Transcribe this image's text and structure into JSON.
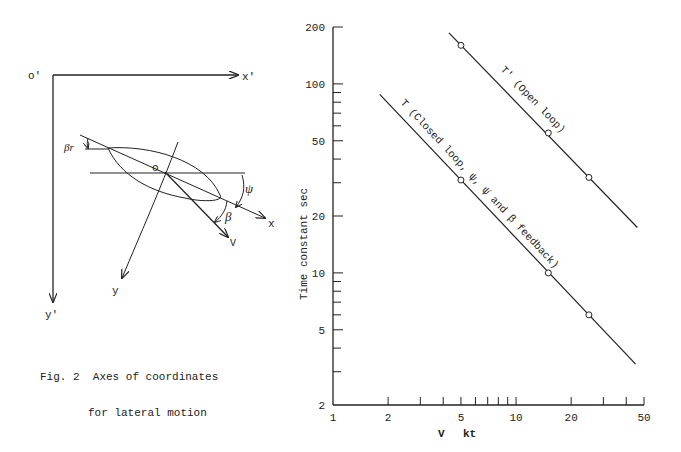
{
  "figure_left": {
    "caption_number": "Fig. 2",
    "caption_line1": "Axes of coordinates",
    "caption_line2": "for lateral motion",
    "labels": {
      "origin_fixed": "o'",
      "x_fixed": "x'",
      "y_fixed": "y'",
      "origin_body": "o",
      "x_body": "x",
      "y_body": "y",
      "velocity": "V",
      "psi": "ψ",
      "beta": "β",
      "beta_r": "βr"
    }
  },
  "figure_right": {
    "ylabel": "Time constant   sec",
    "xlabel_symbol": "V",
    "xlabel_unit": "kt",
    "y_ticks": [
      "200",
      "100",
      "50",
      "20",
      "10",
      "5",
      "2"
    ],
    "x_ticks": [
      "1",
      "2",
      "5",
      "10",
      "20",
      "50"
    ],
    "curve_label_open": "T' (Open loop)",
    "curve_label_closed": "T (Closed loop, ψ, ψ̇ and β feedback)"
  },
  "chart_data": {
    "type": "line",
    "title": "",
    "xlabel": "V  kt",
    "ylabel": "Time constant  sec",
    "xscale": "log",
    "yscale": "log",
    "xlim": [
      1,
      50
    ],
    "ylim": [
      2,
      200
    ],
    "x_tick_labels": [
      "1",
      "2",
      "5",
      "10",
      "20",
      "50"
    ],
    "y_tick_labels": [
      "2",
      "5",
      "10",
      "20",
      "50",
      "100",
      "200"
    ],
    "grid": false,
    "series": [
      {
        "name": "T' (Open loop)",
        "line_x_range": [
          4.3,
          46
        ],
        "points": [
          {
            "x": 5,
            "y": 160
          },
          {
            "x": 15,
            "y": 55
          },
          {
            "x": 25,
            "y": 32
          }
        ]
      },
      {
        "name": "T (Closed loop, ψ, ψ̇ and β feedback)",
        "line_x_range": [
          1.8,
          45
        ],
        "points": [
          {
            "x": 5,
            "y": 31
          },
          {
            "x": 15,
            "y": 10
          },
          {
            "x": 25,
            "y": 6
          }
        ]
      }
    ]
  }
}
